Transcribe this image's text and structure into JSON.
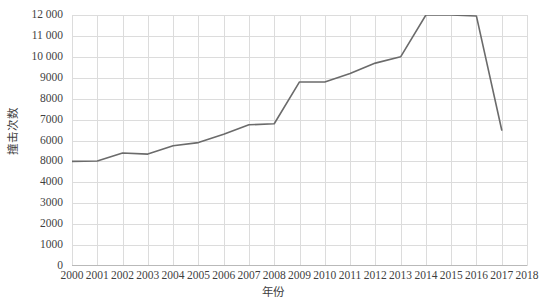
{
  "chart_data": {
    "type": "line",
    "title": "",
    "subtitle": "",
    "xlabel": "年份",
    "ylabel": "撞击次数",
    "x": [
      2000,
      2001,
      2002,
      2003,
      2004,
      2005,
      2006,
      2007,
      2008,
      2009,
      2010,
      2011,
      2012,
      2013,
      2014,
      2015,
      2016,
      2017,
      2018
    ],
    "series": [
      {
        "name": "撞击次数",
        "color": "#6b6b6b",
        "values": [
          5000,
          5020,
          5400,
          5350,
          5750,
          5900,
          6300,
          6750,
          6800,
          8800,
          8800,
          9200,
          9700,
          10000,
          12000,
          12000,
          11950,
          6500,
          null
        ]
      }
    ],
    "x_tick_labels": [
      "2000",
      "2001",
      "2002",
      "2003",
      "2004",
      "2005",
      "2006",
      "2007",
      "2008",
      "2009",
      "2010",
      "2011",
      "2012",
      "2013",
      "2014",
      "2015",
      "2016",
      "2017",
      "2018"
    ],
    "y_tick_labels": [
      "12 000",
      "11 000",
      "10 000",
      "9000",
      "8000",
      "7000",
      "6000",
      "8000",
      "4000",
      "3000",
      "2000",
      "1000",
      "0"
    ],
    "y_tick_positions": [
      12000,
      11000,
      10000,
      9000,
      8000,
      7000,
      6000,
      5000,
      4000,
      3000,
      2000,
      1000,
      0
    ],
    "ylim": [
      0,
      12000
    ],
    "xlim": [
      2000,
      2018
    ],
    "grid": true,
    "grid_color": "#dcdcdc",
    "legend": false,
    "legend_position": "none",
    "line_color": "#6b6b6b",
    "background": "#ffffff"
  }
}
